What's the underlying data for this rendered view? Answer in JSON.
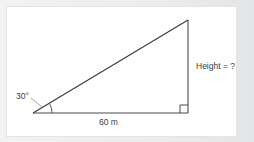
{
  "figure": {
    "type": "right-triangle-diagram",
    "title": "",
    "labels": {
      "angle": "30°",
      "base": "60 m",
      "height": "Height = ?"
    },
    "colors": {
      "background": "#e9eaeb",
      "panel": "#ffffff",
      "stroke": "#3b3b3d",
      "text": "#3b3b3d"
    },
    "geometry": {
      "left_vertex": [
        33,
        113
      ],
      "right_angle_vertex": [
        188,
        113
      ],
      "apex": [
        188,
        20
      ],
      "base_length_label": "60 m",
      "angle_at_left_vertex": "30°",
      "opposite_side_label": "Height = ?",
      "right_angle_marker": true,
      "angle_arc": true
    }
  }
}
